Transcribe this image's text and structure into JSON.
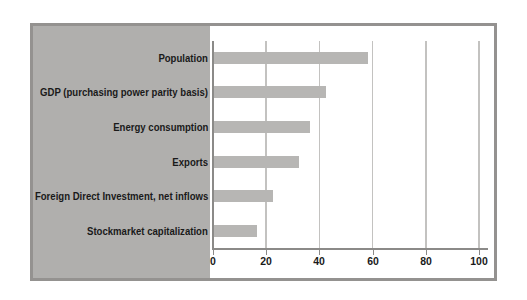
{
  "chart_data": {
    "type": "bar",
    "orientation": "horizontal",
    "title": "",
    "categories": [
      "Population",
      "GDP (purchasing power parity basis)",
      "Energy consumption",
      "Exports",
      "Foreign Direct Investment, net inflows",
      "Stockmarket capitalization"
    ],
    "values": [
      58,
      42,
      36,
      32,
      22,
      16
    ],
    "xlim": [
      0,
      100
    ],
    "xticks": [
      0,
      20,
      40,
      60,
      80,
      100
    ],
    "xtick_labels": [
      "0",
      "20",
      "40",
      "60",
      "80",
      "100"
    ],
    "grid": true,
    "legend": false
  },
  "colors": {
    "background": "#ffffff",
    "panel": "#b0afad",
    "bar": "#b7b6b4",
    "gridline": "#c3c2c0",
    "axis": "#8b8a88",
    "frame_border": "#949290",
    "label_text": "#1a1a1a"
  }
}
